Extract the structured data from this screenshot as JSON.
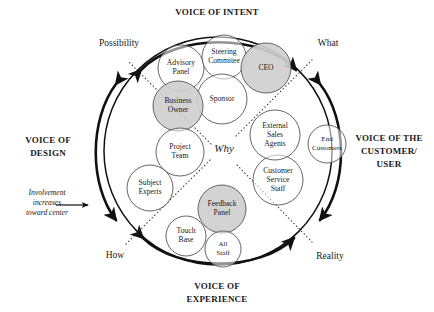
{
  "diagram": {
    "center_label": "Why",
    "titles": {
      "top": "VOICE OF INTENT",
      "bottom_line1": "VOICE OF",
      "bottom_line2": "EXPERIENCE",
      "left_line1": "VOICE OF",
      "left_line2": "DESIGN",
      "right_line1": "VOICE OF THE",
      "right_line2": "CUSTOMER/",
      "right_line3": "USER"
    },
    "axis_labels": {
      "top_left": "Possibility",
      "top_right": "What",
      "bottom_left": "How",
      "bottom_right": "Reality"
    },
    "annotation": {
      "line1": "Involvement",
      "line2": "increases",
      "line3": "toward center"
    },
    "colors": {
      "shaded_fill": "#cfcfcf",
      "plain_fill": "#ffffff",
      "stroke": "#555555",
      "outer_stroke": "#1a1a1a",
      "text": "#1a1a1a"
    },
    "nodes": [
      {
        "id": "advisory-panel",
        "lines": [
          "Advisory",
          "Panel"
        ],
        "cx": 181,
        "cy": 68,
        "r": 23,
        "shaded": false
      },
      {
        "id": "steering-commitee",
        "lines": [
          "Steering",
          "Commitee"
        ],
        "cx": 224,
        "cy": 57,
        "r": 22,
        "shaded": false
      },
      {
        "id": "ceo",
        "lines": [
          "CEO"
        ],
        "cx": 266,
        "cy": 68,
        "r": 25,
        "shaded": true
      },
      {
        "id": "sponsor",
        "lines": [
          "Sponsor"
        ],
        "cx": 222,
        "cy": 99,
        "r": 25,
        "shaded": false
      },
      {
        "id": "business-owner",
        "lines": [
          "Business",
          "Owner"
        ],
        "cx": 178,
        "cy": 106,
        "r": 25,
        "shaded": true
      },
      {
        "id": "project-team",
        "lines": [
          "Project",
          "Team"
        ],
        "cx": 180,
        "cy": 152,
        "r": 24,
        "shaded": false
      },
      {
        "id": "subject-experts",
        "lines": [
          "Subject",
          "Experts"
        ],
        "cx": 150,
        "cy": 188,
        "r": 23,
        "shaded": false
      },
      {
        "id": "touch-base",
        "lines": [
          "Touch",
          "Base"
        ],
        "cx": 186,
        "cy": 236,
        "r": 20,
        "shaded": false
      },
      {
        "id": "feedback-panel",
        "lines": [
          "Feedback",
          "Panel"
        ],
        "cx": 222,
        "cy": 209,
        "r": 24,
        "shaded": true
      },
      {
        "id": "all-staff",
        "lines": [
          "All",
          "Staff"
        ],
        "cx": 223,
        "cy": 249,
        "r": 18,
        "shaded": false
      },
      {
        "id": "customer-service-staff",
        "lines": [
          "Customer",
          "Service",
          "Staff"
        ],
        "cx": 278,
        "cy": 180,
        "r": 25,
        "shaded": false
      },
      {
        "id": "external-sales-agents",
        "lines": [
          "External",
          "Sales",
          "Agents"
        ],
        "cx": 275,
        "cy": 135,
        "r": 25,
        "shaded": false
      },
      {
        "id": "end-customers",
        "lines": [
          "End",
          "Customers"
        ],
        "cx": 327,
        "cy": 144,
        "r": 19,
        "shaded": false
      }
    ]
  }
}
